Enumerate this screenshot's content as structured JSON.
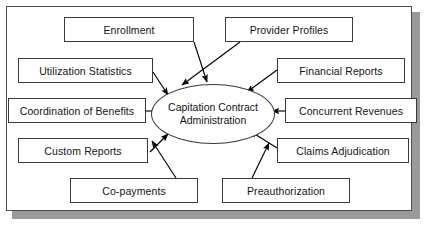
{
  "diagram": {
    "title": "Capitation Contract Administration",
    "hub": {
      "line1": "Capitation Contract",
      "line2": "Administration"
    },
    "colors": {
      "background": "#ffffff",
      "frame_border": "#4d4d4d",
      "frame_shadow": "#9a9a9a",
      "node_border": "#3a3a3a",
      "node_fill": "#ffffff",
      "edge": "#000000",
      "text": "#141414"
    },
    "nodes": [
      {
        "id": "enrollment",
        "label": "Enrollment",
        "x": 64,
        "y": 17,
        "w": 130,
        "h": 25
      },
      {
        "id": "provider-profiles",
        "label": "Provider Profiles",
        "x": 225,
        "y": 17,
        "w": 128,
        "h": 25
      },
      {
        "id": "utilization-statistics",
        "label": "Utilization Statistics",
        "x": 18,
        "y": 58,
        "w": 135,
        "h": 25
      },
      {
        "id": "financial-reports",
        "label": "Financial Reports",
        "x": 277,
        "y": 58,
        "w": 128,
        "h": 25
      },
      {
        "id": "coordination-benefits",
        "label": "Coordination of Benefits",
        "x": 8,
        "y": 98,
        "w": 138,
        "h": 25
      },
      {
        "id": "concurrent-revenues",
        "label": "Concurrent Revenues",
        "x": 285,
        "y": 98,
        "w": 132,
        "h": 25
      },
      {
        "id": "custom-reports",
        "label": "Custom Reports",
        "x": 18,
        "y": 138,
        "w": 130,
        "h": 25
      },
      {
        "id": "claims-adjudication",
        "label": "Claims Adjudication",
        "x": 277,
        "y": 138,
        "w": 132,
        "h": 25
      },
      {
        "id": "co-payments",
        "label": "Co-payments",
        "x": 70,
        "y": 178,
        "w": 128,
        "h": 25
      },
      {
        "id": "preauthorization",
        "label": "Preauthorization",
        "x": 222,
        "y": 178,
        "w": 128,
        "h": 25
      }
    ],
    "hub_geometry": {
      "cx": 213,
      "cy": 114,
      "rx": 62,
      "ry": 30
    },
    "edges": [
      {
        "from": "enrollment",
        "to": "hub",
        "direction": "to-hub"
      },
      {
        "from": "provider-profiles",
        "to": "hub",
        "direction": "to-hub"
      },
      {
        "from": "utilization-statistics",
        "to": "hub",
        "direction": "to-hub"
      },
      {
        "from": "financial-reports",
        "to": "hub",
        "direction": "to-hub"
      },
      {
        "from": "coordination-benefits",
        "to": "hub",
        "direction": "to-hub"
      },
      {
        "from": "concurrent-revenues",
        "to": "hub",
        "direction": "to-hub"
      },
      {
        "from": "custom-reports",
        "to": "hub",
        "direction": "to-hub"
      },
      {
        "from": "claims-adjudication",
        "to": "hub",
        "direction": "to-hub"
      },
      {
        "from": "co-payments",
        "to": "hub",
        "direction": "to-hub"
      },
      {
        "from": "preauthorization",
        "to": "hub",
        "direction": "to-hub"
      }
    ]
  }
}
